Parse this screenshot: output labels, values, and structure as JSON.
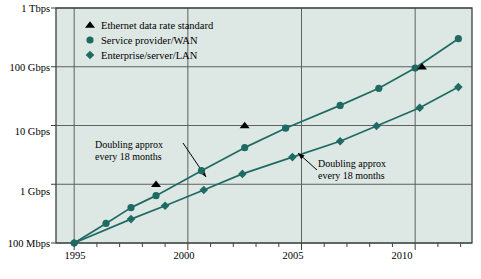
{
  "chart_data": {
    "type": "line",
    "title": "",
    "xlabel": "",
    "ylabel": "",
    "background": "#dde7e4",
    "grid": true,
    "legend_position": "top-left-inside",
    "accent": "#1f6b63",
    "marker_standard_color": "#000000",
    "xlim": [
      1994.2,
      2012.5
    ],
    "ylim_log_mbps": [
      100,
      1000000
    ],
    "y_ticks": [
      {
        "label": "100 Mbps",
        "value_mbps": 100
      },
      {
        "label": "1 Gbps",
        "value_mbps": 1000
      },
      {
        "label": "10 Gbps",
        "value_mbps": 10000
      },
      {
        "label": "100 Gbps",
        "value_mbps": 100000
      },
      {
        "label": "1 Tbps",
        "value_mbps": 1000000
      }
    ],
    "x_major_ticks": [
      {
        "label": "1995",
        "value": 1995
      },
      {
        "label": "2000",
        "value": 2000
      },
      {
        "label": "2005",
        "value": 2005
      },
      {
        "label": "2010",
        "value": 2010
      }
    ],
    "x_minor_ticks": [
      1996,
      1997,
      1998,
      1999,
      2001,
      2002,
      2003,
      2004,
      2006,
      2007,
      2008,
      2009,
      2011,
      2012
    ],
    "legend": [
      {
        "marker": "triangle",
        "label": "Ethernet data rate standard",
        "color": "#000000"
      },
      {
        "marker": "circle",
        "label": "Service provider/WAN",
        "color": "#1f6b63"
      },
      {
        "marker": "diamond",
        "label": "Enterprise/server/LAN",
        "color": "#1f6b63"
      }
    ],
    "series": [
      {
        "name": "Service provider/WAN",
        "marker": "circle",
        "color": "#1f6b63",
        "points": [
          {
            "x": 1995.0,
            "y_mbps": 100
          },
          {
            "x": 1996.4,
            "y_mbps": 215
          },
          {
            "x": 1997.5,
            "y_mbps": 400
          },
          {
            "x": 1998.6,
            "y_mbps": 640
          },
          {
            "x": 2000.6,
            "y_mbps": 1700
          },
          {
            "x": 2002.5,
            "y_mbps": 4200
          },
          {
            "x": 2004.3,
            "y_mbps": 9000
          },
          {
            "x": 2006.7,
            "y_mbps": 22000
          },
          {
            "x": 2008.4,
            "y_mbps": 43000
          },
          {
            "x": 2010.0,
            "y_mbps": 95000
          },
          {
            "x": 2011.9,
            "y_mbps": 300000
          }
        ]
      },
      {
        "name": "Enterprise/server/LAN",
        "marker": "diamond",
        "color": "#1f6b63",
        "points": [
          {
            "x": 1995.0,
            "y_mbps": 100
          },
          {
            "x": 1997.5,
            "y_mbps": 255
          },
          {
            "x": 1999.0,
            "y_mbps": 430
          },
          {
            "x": 2000.7,
            "y_mbps": 800
          },
          {
            "x": 2002.4,
            "y_mbps": 1500
          },
          {
            "x": 2004.6,
            "y_mbps": 2900
          },
          {
            "x": 2006.7,
            "y_mbps": 5400
          },
          {
            "x": 2008.3,
            "y_mbps": 9800
          },
          {
            "x": 2010.2,
            "y_mbps": 20000
          },
          {
            "x": 2011.9,
            "y_mbps": 45000
          }
        ]
      },
      {
        "name": "Ethernet data rate standard",
        "marker": "triangle",
        "color": "#000000",
        "points": [
          {
            "x": 1998.6,
            "y_mbps": 1000
          },
          {
            "x": 2002.5,
            "y_mbps": 10000
          },
          {
            "x": 2010.3,
            "y_mbps": 100000
          }
        ]
      }
    ],
    "annotations": [
      {
        "id": "annot-left",
        "line1": "Doubling approx",
        "line2": "every 18 months"
      },
      {
        "id": "annot-right",
        "line1": "Doubling approx",
        "line2": "every 18 months"
      }
    ]
  }
}
